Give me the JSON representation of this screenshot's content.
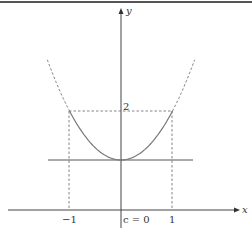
{
  "diagram": {
    "function": "parabola-like curve with minimum at c = 0",
    "axes": {
      "x_label": "x",
      "y_label": "y"
    },
    "x_ticks": [
      {
        "value": -1,
        "label": "−1"
      },
      {
        "value": 0,
        "label": "c = 0"
      },
      {
        "value": 1,
        "label": "1"
      }
    ],
    "y_ticks": [
      {
        "value": 2,
        "label": "2"
      }
    ],
    "min_value": 1,
    "interval": [
      -1,
      1
    ],
    "value_at_endpoints": 2,
    "colors": {
      "axis": "#444444",
      "curve": "#777777",
      "dashed": "#666666",
      "border": "#555555"
    }
  }
}
